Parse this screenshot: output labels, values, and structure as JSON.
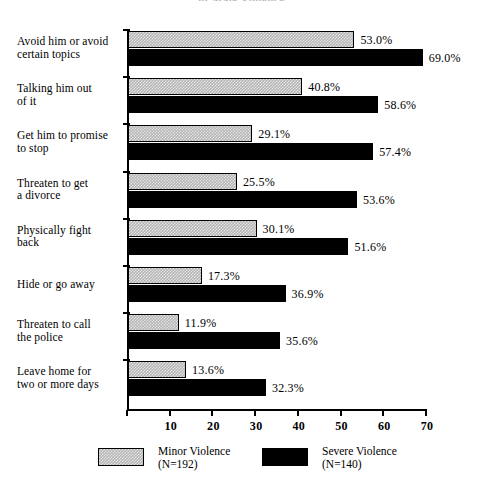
{
  "chart_data": {
    "type": "bar",
    "orientation": "horizontal",
    "title": "of Male Violence",
    "xlabel": "",
    "ylabel": "",
    "xlim": [
      0,
      70
    ],
    "xticks": [
      0,
      10,
      20,
      30,
      40,
      50,
      60,
      70
    ],
    "xticklabels": [
      "",
      "10",
      "20",
      "30",
      "40",
      "50",
      "60",
      "70"
    ],
    "grid": false,
    "legend_position": "bottom",
    "categories": [
      "Avoid him or avoid certain topics",
      "Talking him out of it",
      "Get him to promise to stop",
      "Threaten to get a divorce",
      "Physically fight back",
      "Hide or go away",
      "Threaten to call the police",
      "Leave home for two or more days"
    ],
    "category_lines": [
      [
        "Avoid him or avoid",
        "certain topics"
      ],
      [
        "Talking him out",
        "of it"
      ],
      [
        "Get him to promise",
        "to stop"
      ],
      [
        "Threaten to get",
        "a divorce"
      ],
      [
        "Physically fight",
        "back"
      ],
      [
        "Hide or go away"
      ],
      [
        "Threaten to call",
        "the police"
      ],
      [
        "Leave home for",
        "two or more days"
      ]
    ],
    "series": [
      {
        "name": "Minor Violence",
        "n_label": "(N=192)",
        "color": "#b3b3b3",
        "values": [
          53.0,
          40.8,
          29.1,
          25.5,
          30.1,
          17.3,
          11.9,
          13.6
        ],
        "value_labels": [
          "53.0%",
          "40.8%",
          "29.1%",
          "25.5%",
          "30.1%",
          "17.3%",
          "11.9%",
          "13.6%"
        ]
      },
      {
        "name": "Severe Violence",
        "n_label": "(N=140)",
        "color": "#000000",
        "values": [
          69.0,
          58.6,
          57.4,
          53.6,
          51.6,
          36.9,
          35.6,
          32.3
        ],
        "value_labels": [
          "69.0%",
          "58.6%",
          "57.4%",
          "53.6%",
          "51.6%",
          "36.9%",
          "35.6%",
          "32.3%"
        ]
      }
    ]
  },
  "legend": {
    "entries": [
      {
        "label": "Minor Violence",
        "n_label": "(N=192)",
        "swatch": "minor"
      },
      {
        "label": "Severe Violence",
        "n_label": "(N=140)",
        "swatch": "severe"
      }
    ]
  }
}
